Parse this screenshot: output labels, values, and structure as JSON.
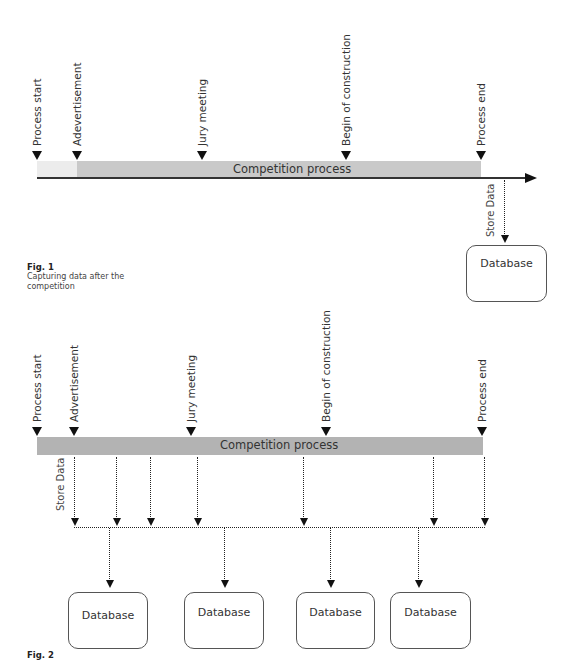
{
  "figure1": {
    "markers": [
      {
        "label": "Process start",
        "x": 37
      },
      {
        "label": "Adevertisement",
        "x": 77
      },
      {
        "label": "Jury meeting",
        "x": 202
      },
      {
        "label": "Begin of construction",
        "x": 346
      },
      {
        "label": "Process end",
        "x": 481
      }
    ],
    "bar_label": "Competition process",
    "store_label": "Store Data",
    "database_label": "Database",
    "caption": {
      "title": "Fig. 1",
      "text": "Capturing data after the competition"
    },
    "colors": {
      "pre_bar": "#ececec",
      "bar": "#c9c9c9",
      "axis": "#333333"
    }
  },
  "figure2": {
    "markers": [
      {
        "label": "Process start",
        "x": 37
      },
      {
        "label": "Advertisement",
        "x": 74
      },
      {
        "label": "Jury meeting",
        "x": 191
      },
      {
        "label": "Begin of construction",
        "x": 326
      },
      {
        "label": "Process end",
        "x": 482
      }
    ],
    "bar_label": "Competition process",
    "store_label": "Store Data",
    "store_points": [
      74,
      116,
      150,
      197,
      303,
      433,
      484
    ],
    "db_links": [
      109,
      224,
      330,
      418
    ],
    "databases": [
      {
        "label": "Database",
        "x": 68,
        "w": 79
      },
      {
        "label": "Database",
        "x": 184,
        "w": 79
      },
      {
        "label": "Database",
        "x": 296,
        "w": 78
      },
      {
        "label": "Database",
        "x": 390,
        "w": 80
      }
    ],
    "caption": {
      "title": "Fig. 2"
    },
    "colors": {
      "bar": "#b3b3b3"
    }
  }
}
